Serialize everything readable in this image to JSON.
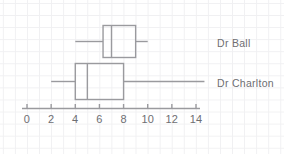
{
  "chart_data": {
    "type": "box",
    "title": "",
    "xlabel": "",
    "ylabel": "",
    "xlim": [
      0,
      14
    ],
    "xticks": [
      0,
      2,
      4,
      6,
      8,
      10,
      12,
      14
    ],
    "xtick_labels": [
      "0",
      "2",
      "4",
      "6",
      "8",
      "10",
      "12",
      "14"
    ],
    "grid": true,
    "grid_color": "#f0f0f2",
    "line_color": "#9a9a9e",
    "text_color": "#6e6e72",
    "orientation": "horizontal",
    "legend_position": "right",
    "series": [
      {
        "name": "Dr Ball",
        "whisker_low": 4,
        "q1": 6.3,
        "median": 7,
        "q3": 9,
        "whisker_high": 10
      },
      {
        "name": "Dr Charlton",
        "whisker_low": 2,
        "q1": 4,
        "median": 5,
        "q3": 8,
        "whisker_high": 14.7
      }
    ]
  },
  "labels": {
    "series_0": "Dr Ball",
    "series_1": "Dr Charlton"
  },
  "axis": {
    "tick_0": "0",
    "tick_1": "2",
    "tick_2": "4",
    "tick_3": "6",
    "tick_4": "8",
    "tick_5": "10",
    "tick_6": "12",
    "tick_7": "14"
  }
}
